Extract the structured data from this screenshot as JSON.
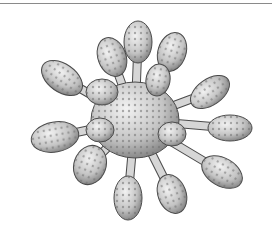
{
  "figure": {
    "colors": {
      "fill": "#cfcfcf",
      "shade": "#8c8c8c",
      "outline": "#4a4a4a",
      "dots": "#7a7a7a",
      "frame_line": "#8a8a8a"
    },
    "body": {
      "cx": 135,
      "cy": 120,
      "rx": 44,
      "ry": 38
    },
    "lobes": [
      {
        "x": 138,
        "y": 42,
        "rx": 14,
        "ry": 21,
        "rot": 0
      },
      {
        "x": 112,
        "y": 57,
        "rx": 14,
        "ry": 20,
        "rot": -20
      },
      {
        "x": 172,
        "y": 52,
        "rx": 14,
        "ry": 20,
        "rot": 18
      },
      {
        "x": 62,
        "y": 78,
        "rx": 23,
        "ry": 14,
        "rot": 35
      },
      {
        "x": 102,
        "y": 92,
        "rx": 16,
        "ry": 13,
        "rot": 0
      },
      {
        "x": 158,
        "y": 80,
        "rx": 12,
        "ry": 16,
        "rot": 10
      },
      {
        "x": 210,
        "y": 92,
        "rx": 22,
        "ry": 13,
        "rot": -35
      },
      {
        "x": 230,
        "y": 128,
        "rx": 22,
        "ry": 13,
        "rot": 0
      },
      {
        "x": 222,
        "y": 172,
        "rx": 22,
        "ry": 14,
        "rot": 30
      },
      {
        "x": 55,
        "y": 137,
        "rx": 24,
        "ry": 15,
        "rot": -10
      },
      {
        "x": 90,
        "y": 165,
        "rx": 16,
        "ry": 20,
        "rot": 20
      },
      {
        "x": 172,
        "y": 134,
        "rx": 14,
        "ry": 12,
        "rot": 0
      },
      {
        "x": 128,
        "y": 198,
        "rx": 14,
        "ry": 22,
        "rot": 0
      },
      {
        "x": 172,
        "y": 194,
        "rx": 14,
        "ry": 20,
        "rot": -20
      },
      {
        "x": 100,
        "y": 130,
        "rx": 14,
        "ry": 12,
        "rot": 0
      }
    ]
  }
}
